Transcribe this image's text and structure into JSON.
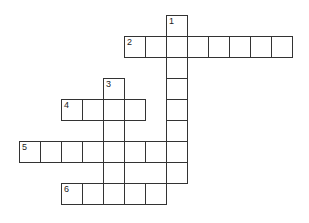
{
  "puzzle": {
    "type": "crossword",
    "border_color": "#333333",
    "entries": [
      {
        "number": "1",
        "direction": "down",
        "row": 0,
        "col": 7,
        "length": 8
      },
      {
        "number": "2",
        "direction": "across",
        "row": 1,
        "col": 5,
        "length": 8
      },
      {
        "number": "3",
        "direction": "down",
        "row": 3,
        "col": 4,
        "length": 6
      },
      {
        "number": "4",
        "direction": "across",
        "row": 4,
        "col": 2,
        "length": 4
      },
      {
        "number": "5",
        "direction": "across",
        "row": 6,
        "col": 0,
        "length": 8
      },
      {
        "number": "6",
        "direction": "across",
        "row": 8,
        "col": 2,
        "length": 5
      }
    ]
  }
}
